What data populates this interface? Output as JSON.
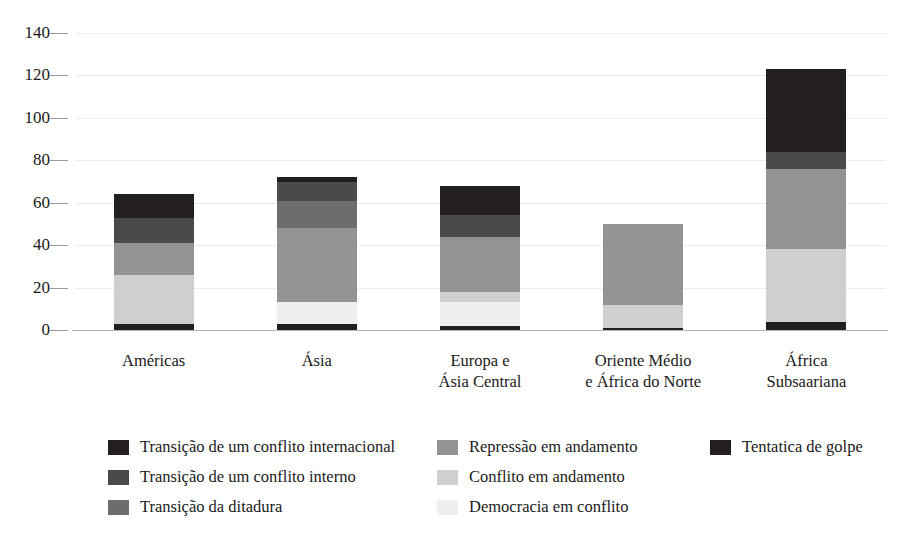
{
  "chart_data": {
    "type": "bar",
    "subtype": "stacked-bar",
    "title": "",
    "xlabel": "",
    "ylabel": "",
    "ylim": [
      0,
      140
    ],
    "yticks": [
      0,
      20,
      40,
      60,
      80,
      100,
      120,
      140
    ],
    "ytick_labels": [
      "0",
      "20",
      "40",
      "60",
      "80",
      "100",
      "120",
      "140"
    ],
    "grid": true,
    "legend_position": "bottom",
    "categories": [
      "Américas",
      "Ásia",
      "Europa e\nÁsia Central",
      "Oriente Médio\ne África do Norte",
      "África\nSubsaariana"
    ],
    "category_lines": [
      [
        "Américas"
      ],
      [
        "Ásia"
      ],
      [
        "Europa e",
        "Ásia Central"
      ],
      [
        "Oriente Médio",
        "e África do Norte"
      ],
      [
        "África",
        "Subsaariana"
      ]
    ],
    "stack_order_bottom_to_top": [
      "Tentatica de golpe",
      "Democracia em conflito",
      "Conflito em andamento",
      "Repressão em andamento",
      "Transição da ditadura",
      "Transição de um conflito interno",
      "Transição de um conflito internacional"
    ],
    "series": [
      {
        "name": "Tentatica de golpe",
        "color": "#231f20",
        "values": [
          3,
          3,
          2,
          1,
          4
        ]
      },
      {
        "name": "Democracia em conflito",
        "color": "#efefef",
        "values": [
          0,
          10,
          11,
          0,
          0
        ]
      },
      {
        "name": "Conflito em andamento",
        "color": "#cfcfcf",
        "values": [
          23,
          0,
          5,
          11,
          34
        ]
      },
      {
        "name": "Repressão em andamento",
        "color": "#939393",
        "values": [
          15,
          35,
          26,
          38,
          38
        ]
      },
      {
        "name": "Transição da ditadura",
        "color": "#6d6d6d",
        "values": [
          0,
          13,
          0,
          0,
          0
        ]
      },
      {
        "name": "Transição de um conflito interno",
        "color": "#4a4a4a",
        "values": [
          12,
          9,
          10,
          0,
          8
        ]
      },
      {
        "name": "Transição de um conflito internacional",
        "color": "#231f20",
        "values": [
          11,
          2,
          14,
          0,
          39
        ]
      }
    ],
    "totals": [
      64,
      72,
      68,
      50,
      123
    ]
  },
  "legend": {
    "columns": [
      {
        "items": [
          {
            "label": "Transição de um conflito internacional",
            "color": "#231f20"
          },
          {
            "label": "Transição de um conflito interno",
            "color": "#4a4a4a"
          },
          {
            "label": "Transição da ditadura",
            "color": "#6d6d6d"
          }
        ]
      },
      {
        "items": [
          {
            "label": "Repressão em andamento",
            "color": "#939393"
          },
          {
            "label": "Conflito em andamento",
            "color": "#cfcfcf"
          },
          {
            "label": "Democracia em conflito",
            "color": "#efefef"
          }
        ]
      },
      {
        "items": [
          {
            "label": "Tentatica de golpe",
            "color": "#231f20"
          }
        ]
      }
    ]
  },
  "colors": {
    "axis": "#b5b5b5",
    "grid": "#ececec",
    "text": "#1a1a1a",
    "background": "#ffffff"
  }
}
